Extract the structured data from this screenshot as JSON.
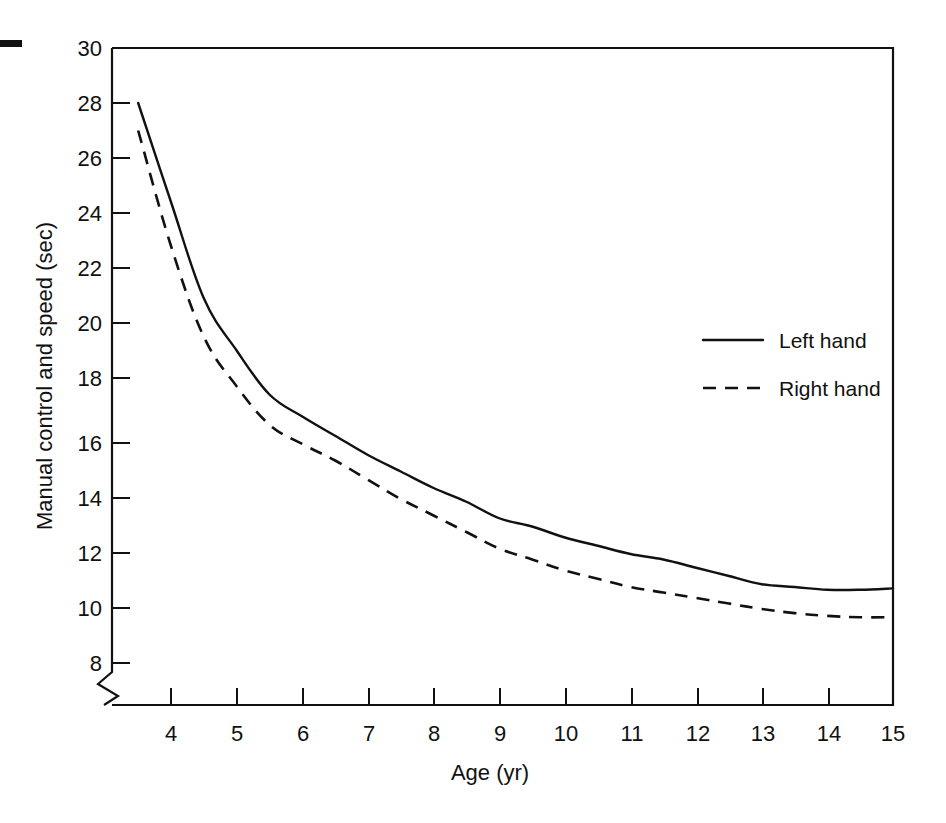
{
  "chart_data": {
    "type": "line",
    "title": "",
    "xlabel": "Age (yr)",
    "ylabel": "Manual control and speed (sec)",
    "xlim": [
      3.0,
      15.0
    ],
    "ylim": [
      7.4,
      30.0
    ],
    "xticks": [
      4,
      5,
      6,
      7,
      8,
      9,
      10,
      11,
      12,
      13,
      14,
      15
    ],
    "xtick_labels": [
      "4",
      "5",
      "6",
      "7",
      "8",
      "9",
      "10",
      "11",
      "12",
      "13",
      "14",
      "15"
    ],
    "yticks": [
      8,
      10,
      12,
      14,
      16,
      18,
      20,
      22,
      24,
      26,
      28,
      30
    ],
    "ytick_labels": [
      "8",
      "10",
      "12",
      "14",
      "16",
      "18",
      "20",
      "22",
      "24",
      "26",
      "28",
      "30"
    ],
    "grid": false,
    "y_axis_break": true,
    "y_axis_break_note": "zig-zag break between 8 and the x-axis baseline",
    "legend_position": "upper right inside plot",
    "series": [
      {
        "name": "Left hand",
        "style": "solid",
        "x": [
          3.5,
          4.0,
          4.5,
          5.0,
          5.5,
          6.0,
          6.5,
          7.0,
          7.5,
          8.0,
          8.5,
          9.0,
          9.5,
          10.0,
          10.5,
          11.0,
          11.5,
          12.0,
          12.5,
          13.0,
          13.5,
          14.0,
          14.5,
          15.0
        ],
        "y": [
          28.0,
          24.4,
          20.9,
          19.0,
          17.4,
          16.6,
          15.9,
          15.2,
          14.6,
          14.0,
          13.5,
          12.9,
          12.6,
          12.2,
          11.9,
          11.6,
          11.4,
          11.1,
          10.8,
          10.5,
          10.4,
          10.3,
          10.3,
          10.35
        ]
      },
      {
        "name": "Right hand",
        "style": "dashed",
        "x": [
          3.5,
          4.0,
          4.5,
          5.0,
          5.5,
          6.0,
          6.5,
          7.0,
          7.5,
          8.0,
          8.5,
          9.0,
          9.5,
          10.0,
          10.5,
          11.0,
          11.5,
          12.0,
          12.5,
          13.0,
          13.5,
          14.0,
          14.5,
          15.0
        ],
        "y": [
          27.0,
          22.8,
          19.5,
          17.7,
          16.3,
          15.6,
          15.0,
          14.3,
          13.6,
          13.0,
          12.4,
          11.8,
          11.4,
          11.0,
          10.7,
          10.4,
          10.2,
          10.0,
          9.8,
          9.6,
          9.45,
          9.35,
          9.3,
          9.3
        ]
      }
    ]
  },
  "legend": {
    "items": [
      {
        "label": "Left hand",
        "style": "solid"
      },
      {
        "label": "Right hand",
        "style": "dashed"
      }
    ]
  },
  "colors": {
    "ink": "#111111",
    "background": "#ffffff"
  }
}
